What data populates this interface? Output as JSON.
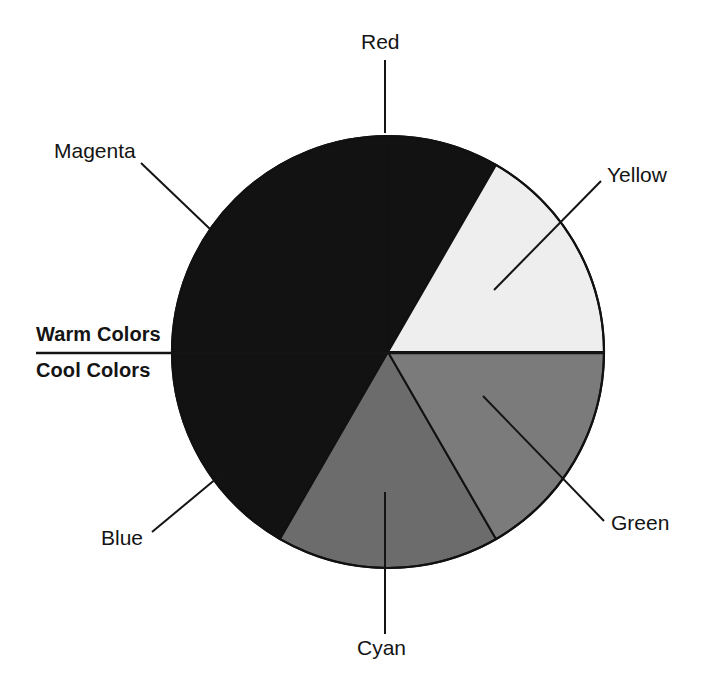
{
  "figure": {
    "center": {
      "x": 388,
      "y": 352
    },
    "radius": 216,
    "stroke": "#111111",
    "background": "#ffffff"
  },
  "chart_data": {
    "type": "pie",
    "xlabel": "",
    "ylabel": "",
    "legend_position": "callout-labels",
    "grid": false,
    "categories": [
      "Red",
      "Yellow",
      "Green",
      "Cyan",
      "Blue",
      "Magenta"
    ],
    "values": [
      30,
      60,
      60,
      60,
      60,
      90
    ],
    "units": "degrees",
    "slices": [
      {
        "label": "Red",
        "start_deg": 0,
        "end_deg": 30,
        "sweep_deg": 30,
        "fill": "#121212",
        "group": "Warm Colors"
      },
      {
        "label": "Yellow",
        "start_deg": 30,
        "end_deg": 90,
        "sweep_deg": 60,
        "fill": "#eeeeee",
        "group": "Warm Colors"
      },
      {
        "label": "Green",
        "start_deg": 90,
        "end_deg": 150,
        "sweep_deg": 60,
        "fill": "#7b7b7b",
        "group": "Cool Colors"
      },
      {
        "label": "Cyan",
        "start_deg": 150,
        "end_deg": 210,
        "sweep_deg": 60,
        "fill": "#6c6c6c",
        "group": "Cool Colors"
      },
      {
        "label": "Blue",
        "start_deg": 210,
        "end_deg": 270,
        "sweep_deg": 60,
        "fill": "#121212",
        "group": "Cool Colors"
      },
      {
        "label": "Magenta",
        "start_deg": 270,
        "end_deg": 360,
        "sweep_deg": 90,
        "fill": "#121212",
        "group": "Warm Colors"
      }
    ],
    "annotations": [
      {
        "text": "Warm Colors",
        "bold": true,
        "side": "left",
        "note": "upper half, above the horizontal divider"
      },
      {
        "text": "Cool Colors",
        "bold": true,
        "side": "left",
        "note": "lower half, below the horizontal divider"
      }
    ]
  },
  "labels": {
    "red": "Red",
    "yellow": "Yellow",
    "green": "Green",
    "cyan": "Cyan",
    "blue": "Blue",
    "magenta": "Magenta",
    "warm": "Warm Colors",
    "cool": "Cool Colors"
  },
  "leaders": {
    "red": {
      "x1": 385,
      "y1": 60,
      "x2": 385,
      "y2": 133
    },
    "magenta": {
      "x1": 141,
      "y1": 163,
      "x2": 210,
      "y2": 229
    },
    "yellow": {
      "x1": 601,
      "y1": 181,
      "x2": 494,
      "y2": 290
    },
    "green": {
      "x1": 604,
      "y1": 521,
      "x2": 483,
      "y2": 396
    },
    "blue": {
      "x1": 152,
      "y1": 532,
      "x2": 223,
      "y2": 473
    },
    "cyan": {
      "x1": 385,
      "y1": 634,
      "x2": 385,
      "y2": 492
    },
    "divider": {
      "x1": 36,
      "y1": 353,
      "x2": 605,
      "y2": 353
    }
  }
}
